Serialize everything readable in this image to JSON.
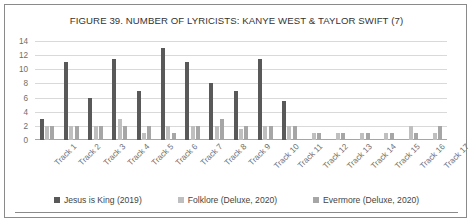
{
  "chart_data": {
    "type": "bar",
    "title": "FIGURE 39. NUMBER OF LYRICISTS: KANYE WEST & TAYLOR SWIFT (7)",
    "xlabel": "",
    "ylabel": "",
    "ylim": [
      0,
      14
    ],
    "yticks": [
      0,
      2,
      4,
      6,
      8,
      10,
      12,
      14
    ],
    "grid": true,
    "legend_position": "bottom",
    "categories": [
      "Track 1",
      "Track 2",
      "Track 3",
      "Track 4",
      "Track 5",
      "Track 6",
      "Track 7",
      "Track 8",
      "Track 9",
      "Track 10",
      "Track 11",
      "Track 12",
      "Track 13",
      "Track 14",
      "Track 15",
      "Track 16",
      "Track 17"
    ],
    "series": [
      {
        "name": "Jesus is King (2019)",
        "color": "#595959",
        "values": [
          3,
          11,
          6,
          11.5,
          7,
          13,
          11,
          8,
          7,
          11.5,
          5.5,
          0,
          0,
          0,
          0,
          0,
          0
        ]
      },
      {
        "name": "Folklore (Deluxe, 2020)",
        "color": "#bfbfbf",
        "values": [
          2,
          2,
          2,
          3,
          1,
          2,
          2,
          2,
          1.5,
          2,
          2,
          1,
          1,
          1,
          1,
          2,
          1
        ]
      },
      {
        "name": "Evermore (Deluxe, 2020)",
        "color": "#a6a6a6",
        "values": [
          2,
          2,
          2,
          2,
          2,
          1,
          2,
          3,
          2,
          2,
          2,
          1,
          1,
          1,
          1,
          1,
          2
        ]
      }
    ]
  }
}
